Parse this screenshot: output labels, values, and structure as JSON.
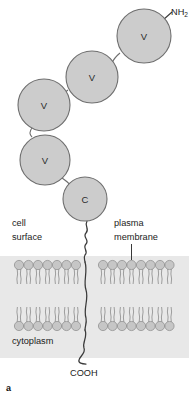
{
  "figure": {
    "panel_letter": "a",
    "background_color": "#ffffff",
    "membrane_band_color": "#e6e6e6",
    "domain_fill": "#cccccc",
    "domain_stroke": "#6e6e6e",
    "chain_stroke": "#3a3a3a",
    "lipid_head_fill": "#c6c6c6",
    "lipid_head_stroke": "#8a8a8a",
    "lipid_tail_stroke": "#8f8f8f"
  },
  "terminus": {
    "n_terminus": "NH",
    "n_terminus_subscript": "2",
    "c_terminus": "COOH"
  },
  "labels": {
    "cell_surface_line1": "cell",
    "cell_surface_line2": "surface",
    "plasma_membrane_line1": "plasma",
    "plasma_membrane_line2": "membrane",
    "cytoplasm": "cytoplasm"
  },
  "domains": [
    {
      "id": "ig-domain-1",
      "letter": "V",
      "cx": 144,
      "cy": 36,
      "r": 27
    },
    {
      "id": "ig-domain-2",
      "letter": "V",
      "cx": 92,
      "cy": 77,
      "r": 26
    },
    {
      "id": "ig-domain-3",
      "letter": "V",
      "cx": 44,
      "cy": 105,
      "r": 26
    },
    {
      "id": "ig-domain-4",
      "letter": "V",
      "cx": 45,
      "cy": 160,
      "r": 25
    },
    {
      "id": "ig-domain-5",
      "letter": "C",
      "cx": 85,
      "cy": 199,
      "r": 22
    }
  ],
  "membrane": {
    "top_y": 262,
    "bottom_y": 330,
    "band_top": 256,
    "band_bottom": 358,
    "left_lipid_count": 9,
    "right_lipid_count": 9,
    "bilayer_leaflets": 2
  }
}
